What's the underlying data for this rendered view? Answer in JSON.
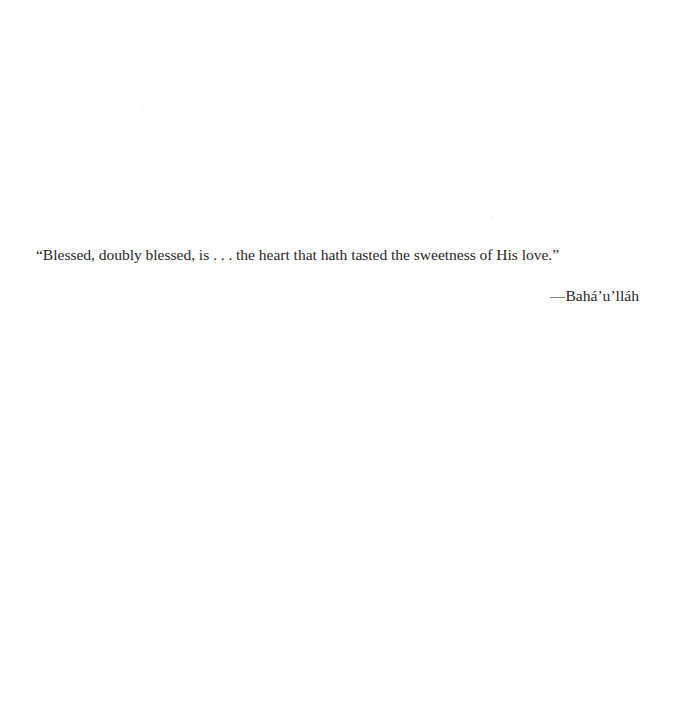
{
  "epigraph": {
    "quote": "“Blessed, doubly blessed, is . . . the heart that hath tasted the sweetness of His love.”",
    "attribution": "—Bahá’u’lláh"
  },
  "colors": {
    "background": "#ffffff",
    "text": "#2a2a2a"
  }
}
